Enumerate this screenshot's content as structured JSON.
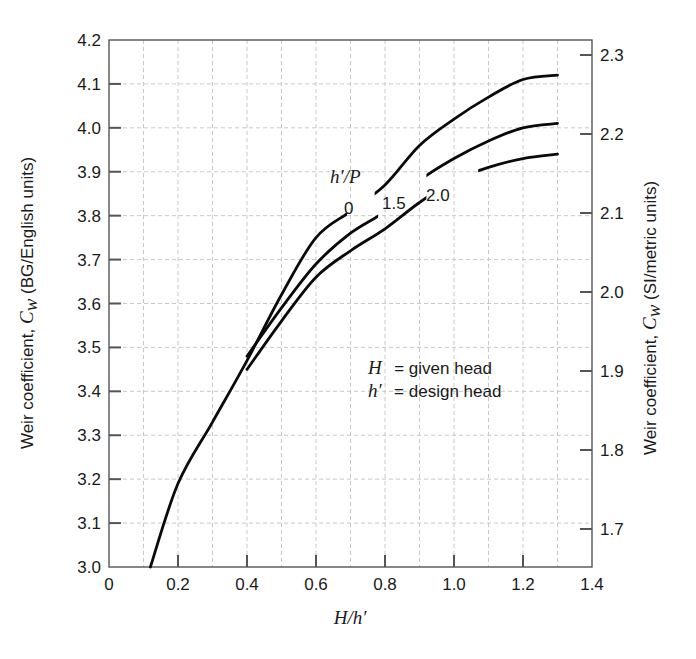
{
  "chart_data": {
    "type": "line",
    "title": "",
    "xlabel": "H/h′",
    "ylabel": "Weir coefficient, Cw (BG/English units)",
    "ylabel_right": "Weir coefficient, Cw (SI/metric units)",
    "xlim": [
      0,
      1.4
    ],
    "ylim": [
      3.0,
      4.2
    ],
    "ylim_right_ticks": [
      1.7,
      1.8,
      1.9,
      2.0,
      2.1,
      2.2,
      2.3
    ],
    "x_ticks": [
      "0",
      "0.2",
      "0.4",
      "0.6",
      "0.8",
      "1.0",
      "1.2",
      "1.4"
    ],
    "y_ticks": [
      "3.0",
      "3.1",
      "3.2",
      "3.3",
      "3.4",
      "3.5",
      "3.6",
      "3.7",
      "3.8",
      "3.9",
      "4.0",
      "4.1",
      "4.2"
    ],
    "y_ticks_right": [
      "1.7",
      "1.8",
      "1.9",
      "2.0",
      "2.1",
      "2.2",
      "2.3"
    ],
    "grid": true,
    "legend_title": "h′/P",
    "series": [
      {
        "name": "0",
        "x": [
          0.12,
          0.2,
          0.3,
          0.4,
          0.5,
          0.6,
          0.7,
          0.8,
          0.9,
          1.0,
          1.1,
          1.2,
          1.3
        ],
        "values": [
          3.0,
          3.19,
          3.33,
          3.47,
          3.62,
          3.75,
          3.81,
          3.87,
          3.96,
          4.02,
          4.07,
          4.11,
          4.12
        ]
      },
      {
        "name": "1.5",
        "x": [
          0.4,
          0.5,
          0.6,
          0.7,
          0.8,
          0.9,
          1.0,
          1.1,
          1.2,
          1.3
        ],
        "values": [
          3.48,
          3.59,
          3.69,
          3.76,
          3.81,
          3.88,
          3.93,
          3.97,
          4.0,
          4.01
        ]
      },
      {
        "name": "2.0",
        "x": [
          0.4,
          0.5,
          0.6,
          0.7,
          0.8,
          0.9,
          1.0,
          1.1,
          1.2,
          1.3
        ],
        "values": [
          3.45,
          3.56,
          3.66,
          3.72,
          3.77,
          3.83,
          3.88,
          3.91,
          3.93,
          3.94
        ]
      }
    ],
    "annotations": [
      "H = given head",
      "h′ = design head"
    ]
  },
  "labels": {
    "legend_title": "h′/P",
    "curve_0": "0",
    "curve_15": "1.5",
    "curve_20": "2.0",
    "def_H_sym": "H",
    "def_H_text": "=  given head",
    "def_h_sym": "h′",
    "def_h_text": "=  design head",
    "xlabel": "H/h′",
    "ylabel_left_prefix": "Weir coefficient, ",
    "ylabel_left_sym": "C",
    "ylabel_left_sub": "w",
    "ylabel_left_suffix": " (BG/English units)",
    "ylabel_right_prefix": "Weir coefficient, ",
    "ylabel_right_sym": "C",
    "ylabel_right_sub": "w",
    "ylabel_right_suffix": " (SI/metric units)"
  },
  "colors": {
    "curve": "#0a0a0a",
    "grid": "#c8c8c8",
    "frame": "#555555"
  }
}
